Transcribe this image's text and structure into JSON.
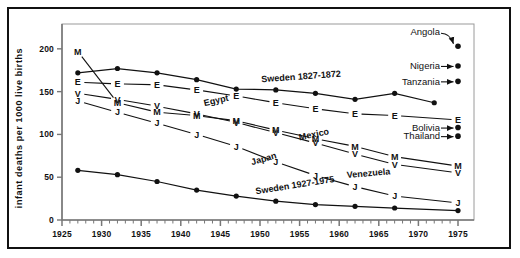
{
  "figure": {
    "background": "#ffffff",
    "ink": "#111111",
    "frame_color": "#111111",
    "plot_border_color": "#9a9a9a"
  },
  "chart_data": {
    "type": "line",
    "title": "",
    "xlabel": "",
    "ylabel": "infant deaths per 1000 live births",
    "xlim": [
      1925,
      1975
    ],
    "ylim": [
      0,
      215
    ],
    "xticks": [
      1925,
      1930,
      1935,
      1940,
      1945,
      1950,
      1955,
      1960,
      1965,
      1970,
      1975
    ],
    "yticks": [
      0,
      50,
      100,
      150,
      200
    ],
    "xtick_labels": [
      "1925",
      "1930",
      "1935",
      "1940",
      "1945",
      "1950",
      "1955",
      "1960",
      "1965",
      "1970",
      "1975"
    ],
    "ytick_labels": [
      "0",
      "50",
      "100",
      "150",
      "200"
    ],
    "minor_xtick_interval": 1,
    "grid": false,
    "legend": "inline-labels",
    "series": [
      {
        "name": "Sweden 1827-1872",
        "label": "Sweden 1827-1872",
        "marker": "dot",
        "x": [
          1927,
          1932,
          1937,
          1942,
          1947,
          1952,
          1957,
          1962,
          1967,
          1972
        ],
        "values": [
          172,
          177,
          172,
          164,
          153,
          152,
          148,
          141,
          148,
          137
        ]
      },
      {
        "name": "Egypt",
        "label": "Egypt",
        "marker": "E",
        "x": [
          1927,
          1932,
          1937,
          1942,
          1947,
          1952,
          1957,
          1962,
          1967,
          1975
        ],
        "values": [
          161,
          159,
          158,
          152,
          145,
          137,
          130,
          124,
          122,
          117
        ]
      },
      {
        "name": "Mexico",
        "label": "Mexico",
        "marker": "M",
        "x": [
          1927,
          1932,
          1937,
          1942,
          1947,
          1952,
          1957,
          1962,
          1967,
          1975
        ],
        "values": [
          197,
          137,
          126,
          122,
          116,
          105,
          95,
          86,
          74,
          63
        ]
      },
      {
        "name": "Venezuela",
        "label": "Venezuela",
        "marker": "V",
        "x": [
          1927,
          1932,
          1937,
          1942,
          1947,
          1952,
          1957,
          1962,
          1967,
          1975
        ],
        "values": [
          148,
          141,
          133,
          124,
          114,
          102,
          90,
          77,
          65,
          55
        ]
      },
      {
        "name": "Japan",
        "label": "Japan",
        "marker": "J",
        "x": [
          1927,
          1932,
          1937,
          1942,
          1947,
          1952,
          1957,
          1962,
          1967,
          1975
        ],
        "values": [
          139,
          126,
          113,
          100,
          86,
          68,
          52,
          39,
          28,
          20
        ]
      },
      {
        "name": "Sweden 1927-1975",
        "label": "Sweden 1927-1975",
        "marker": "dot",
        "x": [
          1927,
          1932,
          1937,
          1942,
          1947,
          1952,
          1957,
          1962,
          1967,
          1975
        ],
        "values": [
          58,
          53,
          45,
          35,
          28,
          22,
          18,
          16,
          14,
          11
        ]
      }
    ],
    "annotations": [
      {
        "label": "Angola",
        "x": 1975,
        "value": 203
      },
      {
        "label": "Nigeria",
        "x": 1975,
        "value": 180
      },
      {
        "label": "Tanzania",
        "x": 1975,
        "value": 162
      },
      {
        "label": "Bolivia",
        "x": 1975,
        "value": 108
      },
      {
        "label": "Thailand",
        "x": 1975,
        "value": 98
      }
    ]
  }
}
